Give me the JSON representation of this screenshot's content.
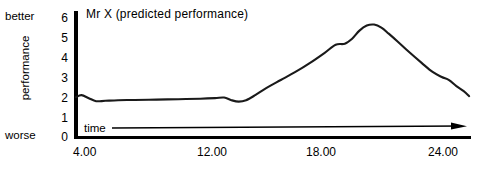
{
  "chart_data": {
    "type": "line",
    "title": "Mr X (predicted performance)",
    "xlabel": "time",
    "ylabel": "performance",
    "ylabel_high": "better",
    "ylabel_low": "worse",
    "xlim": [
      4,
      25.6
    ],
    "ylim": [
      0,
      6
    ],
    "grid": false,
    "legend": false,
    "yticks": [
      "6",
      "5",
      "4",
      "3",
      "2",
      "1",
      "0"
    ],
    "ytick_values": [
      6,
      5,
      4,
      3,
      2,
      1,
      0
    ],
    "xticks": [
      "4.00",
      "12.00",
      "18.00",
      "24.00"
    ],
    "xtick_values": [
      4,
      12,
      18,
      24
    ],
    "series": [
      {
        "name": "predicted performance",
        "x": [
          4.0,
          4.3,
          4.7,
          5.1,
          5.6,
          6.3,
          7.2,
          8.4,
          9.6,
          10.8,
          11.6,
          12.1,
          12.5,
          12.9,
          13.3,
          13.8,
          14.4,
          15.2,
          16.0,
          16.8,
          17.6,
          18.2,
          18.7,
          19.1,
          19.5,
          19.9,
          20.3,
          20.7,
          21.1,
          21.6,
          22.2,
          22.9,
          23.5,
          24.0,
          24.4,
          24.8,
          25.2,
          25.5
        ],
        "y": [
          2.0,
          2.1,
          1.95,
          1.8,
          1.82,
          1.85,
          1.86,
          1.88,
          1.9,
          1.92,
          1.95,
          1.98,
          1.85,
          1.78,
          1.85,
          2.1,
          2.45,
          2.85,
          3.25,
          3.7,
          4.2,
          4.6,
          4.65,
          4.9,
          5.3,
          5.55,
          5.6,
          5.45,
          5.15,
          4.75,
          4.25,
          3.7,
          3.25,
          3.0,
          2.85,
          2.55,
          2.3,
          2.05
        ]
      }
    ]
  },
  "axis": {
    "time_arrow": "arrow-right"
  }
}
